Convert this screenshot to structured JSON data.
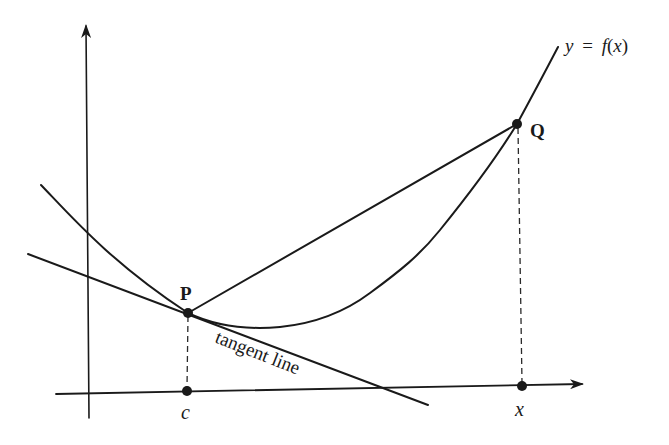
{
  "figure": {
    "curve_label": "y = f(x)",
    "curve_label_parts": {
      "y": "y",
      "eq": "=",
      "f": "f",
      "open": "(",
      "x": "x",
      "close": ")"
    },
    "point_p_label": "P",
    "point_q_label": "Q",
    "x_c_label": "c",
    "x_x_label": "x",
    "tangent_label": "tangent line"
  },
  "colors": {
    "ink": "#1a1a1a",
    "background": "#ffffff"
  }
}
